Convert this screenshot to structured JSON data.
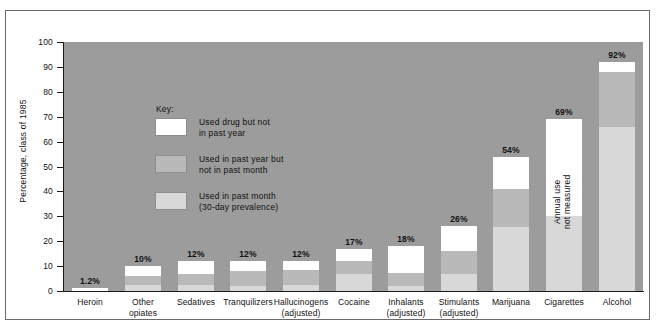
{
  "chart_data": {
    "type": "bar",
    "title": "",
    "subtitle": "",
    "xlabel": "",
    "ylabel": "Percentage, class of 1985",
    "ylim": [
      0,
      100
    ],
    "yticks": [
      0,
      10,
      20,
      30,
      40,
      50,
      60,
      70,
      80,
      90,
      100
    ],
    "ytick_labels": [
      "0",
      "10",
      "20",
      "30",
      "40",
      "50",
      "60",
      "70",
      "80",
      "90",
      "100"
    ],
    "grid": false,
    "stacked": true,
    "legend_position": "inside-upper-left",
    "plot_background": "#9c9c9c",
    "categories": [
      "Heroin",
      "Other opiates",
      "Sedatives",
      "Tranquilizers",
      "Hallucinogens (adjusted)",
      "Cocaine",
      "Inhalants (adjusted)",
      "Stimulants (adjusted)",
      "Marijuana",
      "Cigarettes",
      "Alcohol"
    ],
    "category_label_lines": [
      [
        "Heroin"
      ],
      [
        "Other",
        "opiates"
      ],
      [
        "Sedatives"
      ],
      [
        "Tranquilizers"
      ],
      [
        "Hallucinogens",
        "(adjusted)"
      ],
      [
        "Cocaine"
      ],
      [
        "Inhalants",
        "(adjusted)"
      ],
      [
        "Stimulants",
        "(adjusted)"
      ],
      [
        "Marijuana"
      ],
      [
        "Cigarettes"
      ],
      [
        "Alcohol"
      ]
    ],
    "series": [
      {
        "name": "Used in past month (30-day prevalence)",
        "color": "#d8d8d8",
        "values": [
          0,
          2.3,
          2.4,
          2.1,
          2.5,
          6.7,
          2.2,
          6.8,
          25.7,
          30,
          65.9
        ]
      },
      {
        "name": "Used in past year but not in past month",
        "color": "#b9b9b9",
        "values": [
          0,
          3.7,
          4.6,
          5.9,
          6.1,
          5.3,
          5.2,
          9.2,
          15.3,
          0,
          22.1
        ]
      },
      {
        "name": "Used drug but not in past year",
        "color": "#ffffff",
        "values": [
          1.2,
          4.0,
          5.0,
          4.0,
          3.4,
          5.0,
          10.6,
          10.0,
          13.0,
          39,
          4.0
        ]
      }
    ],
    "totals": [
      1.2,
      10,
      12,
      12,
      12,
      17,
      18,
      26,
      54,
      69,
      92
    ],
    "value_labels": [
      "1.2%",
      "10%",
      "12%",
      "12%",
      "12%",
      "17%",
      "18%",
      "26%",
      "54%",
      "69%",
      "92%"
    ],
    "annotations": [
      {
        "text": "Annual use not measured",
        "lines": [
          "Annual use",
          "not measured"
        ],
        "category": "Cigarettes",
        "orientation": "vertical"
      }
    ]
  },
  "legend": {
    "title": "Key:",
    "items": [
      {
        "swatch": "#ffffff",
        "lines": [
          "Used drug but not",
          "in past year"
        ]
      },
      {
        "swatch": "#b9b9b9",
        "lines": [
          "Used in past year but",
          "not in past month"
        ]
      },
      {
        "swatch": "#d8d8d8",
        "lines": [
          "Used in past month",
          "(30-day prevalence)"
        ]
      }
    ]
  }
}
